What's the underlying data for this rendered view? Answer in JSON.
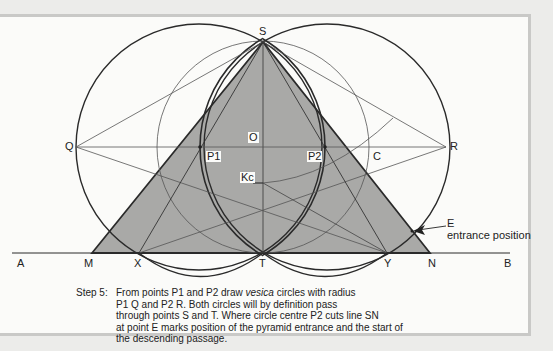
{
  "diagram": {
    "points": {
      "S": "S",
      "Q": "Q",
      "R": "R",
      "O": "O",
      "P1": "P1",
      "P2": "P2",
      "C": "C",
      "Kc": "Kc",
      "E": "E",
      "A": "A",
      "M": "M",
      "X": "X",
      "T": "T",
      "Y": "Y",
      "N": "N",
      "B": "B"
    },
    "annotation": "entrance position",
    "colors": {
      "fill": "#a9a9a7",
      "line": "#2a2a2a",
      "thin": "#555555",
      "frame": "#c9c9c7"
    }
  },
  "caption": {
    "step": "Step 5:",
    "line1_pre": "From points P1 and P2 draw ",
    "line1_italic": "vesica",
    "line1_post": " circles with radius",
    "line2": "P1 Q and P2 R. Both circles will by definition pass",
    "line3": "through points S and T. Where circle centre P2 cuts line SN",
    "line4": "at point E marks position of the pyramid entrance and the start of",
    "line5": "the descending passage."
  }
}
